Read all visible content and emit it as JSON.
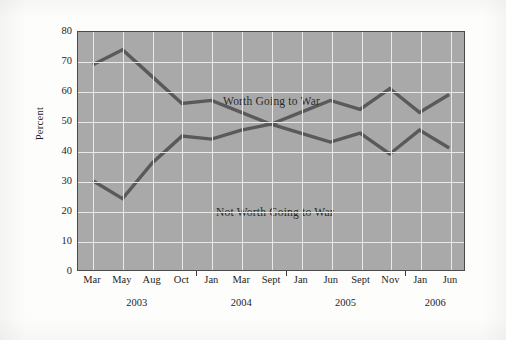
{
  "chart_data": {
    "type": "line",
    "title": "",
    "subtitle": "",
    "xlabel": "",
    "ylabel": "Percent",
    "ylim": [
      0,
      80
    ],
    "ytick_step": 10,
    "yticks": [
      80,
      70,
      60,
      50,
      40,
      30,
      20,
      10,
      0
    ],
    "grid": true,
    "legend_position": "inline-annotation",
    "categories": [
      "Mar",
      "May",
      "Aug",
      "Oct",
      "Jan",
      "Mar",
      "Sept",
      "Jan",
      "Jun",
      "Sept",
      "Nov",
      "Jan",
      "Jun"
    ],
    "year_groups": [
      {
        "label": "2003",
        "start_index": 0,
        "end_index": 3
      },
      {
        "label": "2004",
        "start_index": 4,
        "end_index": 6
      },
      {
        "label": "2005",
        "start_index": 7,
        "end_index": 10
      },
      {
        "label": "2006",
        "start_index": 11,
        "end_index": 12
      }
    ],
    "series": [
      {
        "name": "Worth Going to War",
        "color": "#5a5a5a",
        "values": [
          69,
          74,
          65,
          56,
          57,
          53,
          49,
          46,
          43,
          46,
          39,
          47,
          41
        ]
      },
      {
        "name": "Not Worth Going to War",
        "color": "#5a5a5a",
        "values": [
          30,
          24,
          36,
          45,
          44,
          47,
          49,
          53,
          57,
          54,
          61,
          53,
          59
        ]
      }
    ],
    "annotations": [
      {
        "text": "Worth Going to War",
        "series": "Worth Going to War"
      },
      {
        "text": "Not Worth Going to War",
        "series": "Not Worth Going to War"
      }
    ]
  },
  "axis": {
    "y_title": "Percent",
    "y_labels": [
      "80",
      "70",
      "60",
      "50",
      "40",
      "30",
      "20",
      "10",
      "0"
    ],
    "x_labels": [
      "Mar",
      "May",
      "Aug",
      "Oct",
      "Jan",
      "Mar",
      "Sept",
      "Jan",
      "Jun",
      "Sept",
      "Nov",
      "Jan",
      "Jun"
    ],
    "year_labels": [
      "2003",
      "2004",
      "2005",
      "2006"
    ]
  },
  "labels": {
    "worth": "Worth Going to War",
    "not_worth": "Not Worth Going to War"
  },
  "colors": {
    "plot_background": "#a9a9a9",
    "gridline": "#e9e9e6",
    "line": "#5a5a5a",
    "axis_border": "#4a4a4a",
    "text": "#1d1d1c",
    "page_background": "#fdfdfc"
  }
}
